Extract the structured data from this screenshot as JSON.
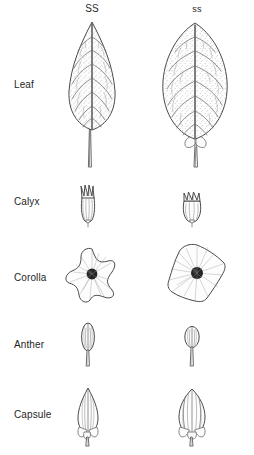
{
  "figure": {
    "type": "botanical-comparison-diagram",
    "columns": [
      {
        "id": "dominant",
        "label": "SS"
      },
      {
        "id": "recessive",
        "label": "ss"
      }
    ],
    "rows": [
      {
        "id": "leaf",
        "label": "Leaf"
      },
      {
        "id": "calyx",
        "label": "Calyx"
      },
      {
        "id": "corolla",
        "label": "Corolla"
      },
      {
        "id": "anther",
        "label": "Anther"
      },
      {
        "id": "capsule",
        "label": "Capsule"
      }
    ],
    "specimens": {
      "leaf_ss": {
        "name": "leaf-specimen-ss",
        "shape": "narrow elliptic, acuminate apex, long petiole"
      },
      "leaf_ss_rec": {
        "name": "leaf-specimen-ss-rec",
        "shape": "broad ovate, rounded apex, short petiole with lobed base"
      },
      "calyx_ss": {
        "name": "calyx-specimen-ss",
        "shape": "elongate tubular with long acute lobes"
      },
      "calyx_ss_rec": {
        "name": "calyx-specimen-ss-rec",
        "shape": "short campanulate with short lobes"
      },
      "corolla_ss": {
        "name": "corolla-specimen-ss",
        "shape": "star-shaped, five deep acute lobes"
      },
      "corolla_ss_rec": {
        "name": "corolla-specimen-ss-rec",
        "shape": "pentagonal, five shallow broad lobes"
      },
      "anther_ss": {
        "name": "anther-specimen-ss",
        "shape": "narrow elongate ellipsoid on filament"
      },
      "anther_ss_rec": {
        "name": "anther-specimen-ss-rec",
        "shape": "short broad ellipsoid on filament"
      },
      "capsule_ss": {
        "name": "capsule-specimen-ss",
        "shape": "ovoid with acute apex, stalked"
      },
      "capsule_ss_rec": {
        "name": "capsule-specimen-ss-rec",
        "shape": "broadly ovoid, obtuse apex, stalked"
      }
    },
    "colors": {
      "background": "#ffffff",
      "ink": "#4a4a4a",
      "text": "#1f1f1f",
      "center_dark": "#252525"
    }
  }
}
